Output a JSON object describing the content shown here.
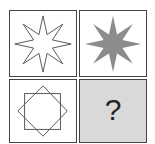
{
  "puzzle": {
    "cells": [
      {
        "position": "top-left",
        "shape": "8-point-star-outline",
        "fill": "none",
        "stroke": "#555555"
      },
      {
        "position": "top-right",
        "shape": "8-point-star-filled",
        "fill": "#8c8c8c"
      },
      {
        "position": "bottom-left",
        "shape": "two-overlapping-squares-outline",
        "fill": "none",
        "stroke": "#555555"
      },
      {
        "position": "bottom-right",
        "shape": "unknown",
        "background": "#d9d9d9",
        "label": "?"
      }
    ]
  }
}
